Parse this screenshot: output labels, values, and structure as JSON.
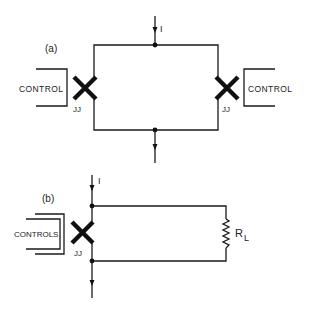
{
  "figure": {
    "panel_a": {
      "label": "(a)",
      "current_label": "I",
      "left_control_label": "CONTROL",
      "right_control_label": "CONTROL",
      "left_junction_label": "JJ",
      "right_junction_label": "JJ"
    },
    "panel_b": {
      "label": "(b)",
      "current_label": "I",
      "control_label": "CONTROLS",
      "junction_label": "JJ",
      "resistor_label": "R",
      "resistor_subscript": "L"
    }
  }
}
